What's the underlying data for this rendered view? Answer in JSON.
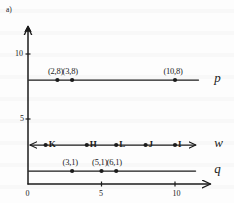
{
  "figure": {
    "part_label": "a)",
    "ink_color": "#1b1b1b",
    "paper_color": "#fdfdfd"
  },
  "chart_data": {
    "type": "scatter",
    "title": "a)",
    "xlabel": "",
    "ylabel": "",
    "xlim": [
      -0.6,
      12.4
    ],
    "ylim": [
      -0.4,
      12.2
    ],
    "grid": false,
    "legend": "none",
    "x_ticks": [
      {
        "value": 0,
        "label": "0"
      },
      {
        "value": 5,
        "label": "5"
      },
      {
        "value": 10,
        "label": "10"
      }
    ],
    "y_ticks": [
      {
        "value": 5,
        "label": "5"
      },
      {
        "value": 10,
        "label": "10"
      }
    ],
    "lines": [
      {
        "name": "p",
        "label": "p",
        "y": 8,
        "x_start": 0.05,
        "x_end": 11.6,
        "arrow_left": false,
        "arrow_right": false,
        "points": [
          {
            "x": 2,
            "y": 8,
            "label": "(2,8)"
          },
          {
            "x": 3,
            "y": 8,
            "label": "(3,8)"
          },
          {
            "x": 10,
            "y": 8,
            "label": "(10,8)"
          }
        ]
      },
      {
        "name": "w",
        "label": "w",
        "y": 3,
        "x_start": 0.15,
        "x_end": 11.4,
        "arrow_left": true,
        "arrow_right": true,
        "points": [
          {
            "x": 1.2,
            "y": 3,
            "label": "K"
          },
          {
            "x": 4,
            "y": 3,
            "label": "H"
          },
          {
            "x": 6,
            "y": 3,
            "label": "L"
          },
          {
            "x": 8,
            "y": 3,
            "label": "J"
          },
          {
            "x": 10,
            "y": 3,
            "label": "I"
          }
        ]
      },
      {
        "name": "q",
        "label": "q",
        "y": 1,
        "x_start": 0.05,
        "x_end": 11.4,
        "arrow_left": false,
        "arrow_right": false,
        "points": [
          {
            "x": 3,
            "y": 1,
            "label": "(3,1)"
          },
          {
            "x": 5,
            "y": 1,
            "label": "(5,1)"
          },
          {
            "x": 6,
            "y": 1,
            "label": "(6,1)"
          }
        ]
      }
    ]
  }
}
